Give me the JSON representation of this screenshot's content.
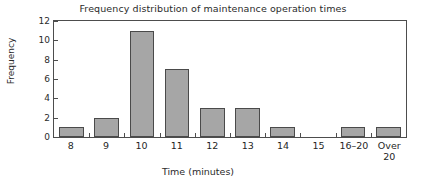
{
  "chart_data": {
    "type": "bar",
    "title": "Frequency distribution of maintenance operation times",
    "xlabel": "Time (minutes)",
    "ylabel": "Frequency",
    "categories": [
      "8",
      "9",
      "10",
      "11",
      "12",
      "13",
      "14",
      "15",
      "16–20",
      "Over\n20"
    ],
    "values": [
      1,
      2,
      11,
      7,
      3,
      3,
      1,
      0,
      1,
      1
    ],
    "ylim": [
      0,
      12
    ],
    "yticks": [
      0,
      2,
      4,
      6,
      8,
      10,
      12
    ],
    "ytick_labels": [
      "0",
      "2",
      "4",
      "6",
      "8",
      "10",
      "12"
    ],
    "grid": false,
    "legend": null,
    "bar_color": "#a6a6a6",
    "bar_edge_color": "#4a4a4a",
    "axis_color": "#4d4d4d",
    "background": "#ffffff"
  }
}
